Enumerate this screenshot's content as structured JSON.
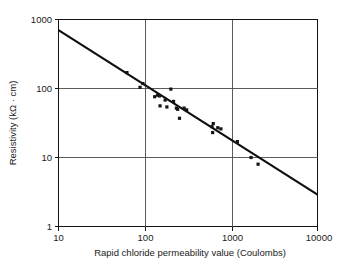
{
  "chart_data": {
    "type": "scatter",
    "title": "",
    "xlabel": "Rapid chloride permeability value (Coulombs)",
    "ylabel": "Resistivity (kΩ · cm)",
    "xscale": "log",
    "yscale": "log",
    "xlim": [
      10,
      10000
    ],
    "ylim": [
      1,
      1000
    ],
    "xticks": [
      10,
      100,
      1000,
      10000
    ],
    "xtick_labels": [
      "10",
      "100",
      "1000",
      "10000"
    ],
    "yticks": [
      1,
      10,
      100,
      1000
    ],
    "ytick_labels": [
      "1",
      "10",
      "100",
      "1000"
    ],
    "grid": true,
    "grid_note": "Interior gridlines drawn at x = 100 and x = 1000 and at y = 10 and y = 100",
    "legend": null,
    "legend_position": "none",
    "marker_style": "filled-square",
    "series": [
      {
        "name": "Measured specimens",
        "points": [
          [
            62,
            170
          ],
          [
            88,
            104
          ],
          [
            95,
            118
          ],
          [
            130,
            76
          ],
          [
            140,
            80
          ],
          [
            148,
            78
          ],
          [
            150,
            56
          ],
          [
            172,
            68
          ],
          [
            180,
            54
          ],
          [
            200,
            98
          ],
          [
            215,
            65
          ],
          [
            232,
            52
          ],
          [
            240,
            50
          ],
          [
            252,
            37
          ],
          [
            285,
            52
          ],
          [
            305,
            49
          ],
          [
            600,
            28
          ],
          [
            610,
            23
          ],
          [
            620,
            31
          ],
          [
            700,
            27
          ],
          [
            760,
            26
          ],
          [
            1180,
            17
          ],
          [
            1700,
            10
          ],
          [
            2050,
            8
          ]
        ]
      }
    ],
    "trend_line": {
      "label": "best-fit power-law regression",
      "x_start": 10,
      "y_start": 700,
      "x_end": 10000,
      "y_end": 2.9
    }
  },
  "axes": {
    "x_title": "Rapid chloride permeability value (Coulombs)",
    "y_title": "Resistivity (kΩ · cm)",
    "x_tick_0": "10",
    "x_tick_1": "100",
    "x_tick_2": "1000",
    "x_tick_3": "10000",
    "y_tick_0": "1",
    "y_tick_1": "10",
    "y_tick_2": "100",
    "y_tick_3": "1000"
  }
}
